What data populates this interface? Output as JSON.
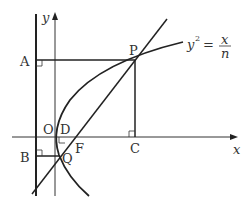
{
  "diagram": {
    "labels": {
      "y_axis": "y",
      "x_axis": "x",
      "A": "A",
      "P": "P",
      "O": "O",
      "D": "D",
      "F": "F",
      "B": "B",
      "Q": "Q",
      "C": "C"
    },
    "equation": {
      "lhs": "y",
      "exp": "2",
      "eq": "=",
      "num": "x",
      "den": "n"
    },
    "colors": {
      "stroke": "#222222",
      "text": "#333333"
    }
  }
}
